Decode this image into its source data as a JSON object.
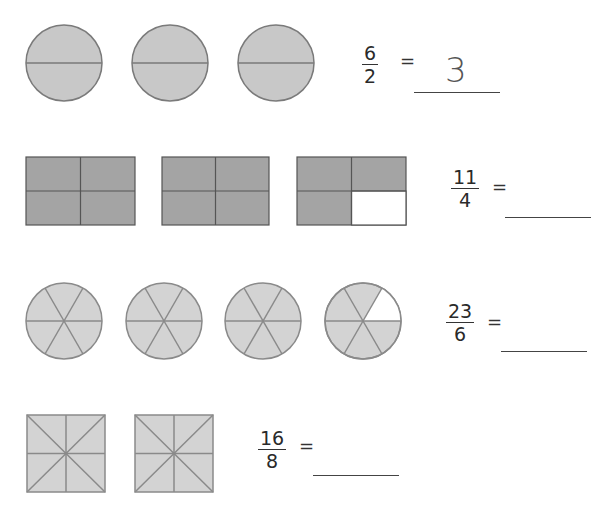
{
  "colors": {
    "fill_circle_halves": "#c8c8c8",
    "fill_rect": "#a4a4a4",
    "fill_light": "#d3d3d3",
    "stroke": "#777777",
    "empty": "#ffffff"
  },
  "problems": [
    {
      "id": "halves",
      "shape": "circle",
      "parts_per_whole": 2,
      "wholes": 3,
      "shaded_parts": 6,
      "numerator": "6",
      "denominator": "2",
      "equals": "=",
      "answer": "3"
    },
    {
      "id": "quarters",
      "shape": "rectangle",
      "parts_per_whole": 4,
      "wholes": 3,
      "shaded_parts": 11,
      "numerator": "11",
      "denominator": "4",
      "equals": "=",
      "answer": ""
    },
    {
      "id": "sixths",
      "shape": "circle",
      "parts_per_whole": 6,
      "wholes": 4,
      "shaded_parts": 23,
      "numerator": "23",
      "denominator": "6",
      "equals": "=",
      "answer": ""
    },
    {
      "id": "eighths",
      "shape": "square",
      "parts_per_whole": 8,
      "wholes": 2,
      "shaded_parts": 16,
      "numerator": "16",
      "denominator": "8",
      "equals": "=",
      "answer": ""
    }
  ]
}
